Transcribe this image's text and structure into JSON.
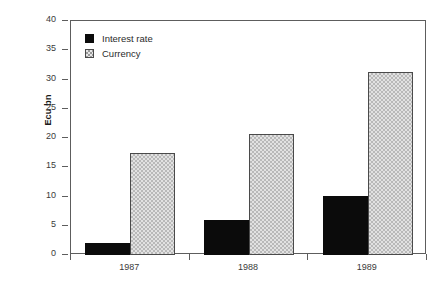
{
  "chart_data": {
    "type": "bar",
    "title": "",
    "subtitle": "",
    "xlabel": "",
    "ylabel": "Ecu bn",
    "categories": [
      "1987",
      "1988",
      "1989"
    ],
    "series": [
      {
        "name": "Interest rate",
        "values": [
          2.0,
          6.0,
          10.1
        ],
        "color": "#0b0b0b",
        "pattern": "solid"
      },
      {
        "name": "Currency",
        "values": [
          17.5,
          20.7,
          31.3
        ],
        "color": "#e2e2e2",
        "pattern": "checkered"
      }
    ],
    "ylim": [
      0,
      40
    ],
    "yticks": [
      0,
      5,
      10,
      15,
      20,
      25,
      30,
      35,
      40
    ],
    "ytick_labels": [
      "0",
      "5",
      "10",
      "15",
      "20",
      "25",
      "30",
      "35",
      "40"
    ],
    "grid": false,
    "legend_position": "top-left-inside",
    "frame": true,
    "bar_group_count": 3,
    "bars_per_group": 2
  },
  "legend": {
    "entries": [
      {
        "label": "Interest rate",
        "swatch": "solid-black-square"
      },
      {
        "label": "Currency",
        "swatch": "checkered-gray-square"
      }
    ]
  },
  "axes": {
    "y_axis_title": "Ecu bn",
    "y_tick_labels": [
      "40",
      "35",
      "30",
      "25",
      "20",
      "15",
      "10",
      "5",
      "0"
    ],
    "x_tick_labels": [
      "1987",
      "1988",
      "1989"
    ]
  }
}
